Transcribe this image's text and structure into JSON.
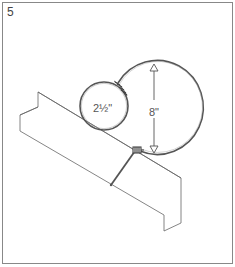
{
  "figure": {
    "step_number": "5",
    "small_loop_label": "2½\"",
    "large_loop_label": "8\"",
    "colors": {
      "line": "#555555",
      "frame": "#777777",
      "background": "#ffffff"
    },
    "icons": [
      "wire-wrap-icon",
      "dimension-arrow-icon"
    ]
  }
}
